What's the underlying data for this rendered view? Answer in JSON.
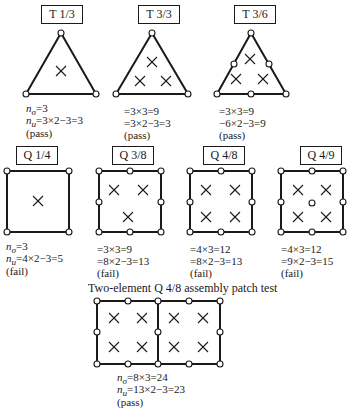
{
  "diagram": {
    "caption": "Two-element Q 4/8 assembly patch test",
    "elements": [
      {
        "id": "T1/3",
        "title": "T 1/3",
        "line1": "nσ=3",
        "line2": "nu=3×2−3=3",
        "result": "(pass)"
      },
      {
        "id": "T3/3",
        "title": "T 3/3",
        "line1": "=3×3=9",
        "line2": "=3×2−3=3",
        "result": "(pass)"
      },
      {
        "id": "T3/6",
        "title": "T 3/6",
        "line1": "=3×3=9",
        "line2": "−6×2−3=9",
        "result": "(pass)"
      },
      {
        "id": "Q1/4",
        "title": "Q 1/4",
        "line1": "nσ=3",
        "line2": "nu=4×2−3=5",
        "result": "(fail)"
      },
      {
        "id": "Q3/8",
        "title": "Q 3/8",
        "line1": "=3×3=9",
        "line2": "=8×2−3=13",
        "result": "(fail)"
      },
      {
        "id": "Q4/8",
        "title": "Q 4/8",
        "line1": "=4×3=12",
        "line2": "=8×2−3=13",
        "result": "(fail)"
      },
      {
        "id": "Q4/9",
        "title": "Q 4/9",
        "line1": "=4×3=12",
        "line2": "=9×2−3=15",
        "result": "(fail)"
      }
    ],
    "assembly": {
      "line1": "nσ=8×3=24",
      "line2": "nu=13×2−3=23",
      "result": "(pass)"
    },
    "labels": {
      "n_sigma_prefix": "n",
      "sigma_sub": "σ",
      "u_sub": "u",
      "t13_l1": "=3",
      "t13_l2": "=3×2−3=3",
      "q14_l1": "=3",
      "q14_l2": "=4×2−3=5",
      "as_l1": "=8×3=24",
      "as_l2": "=13×2−3=23"
    }
  }
}
